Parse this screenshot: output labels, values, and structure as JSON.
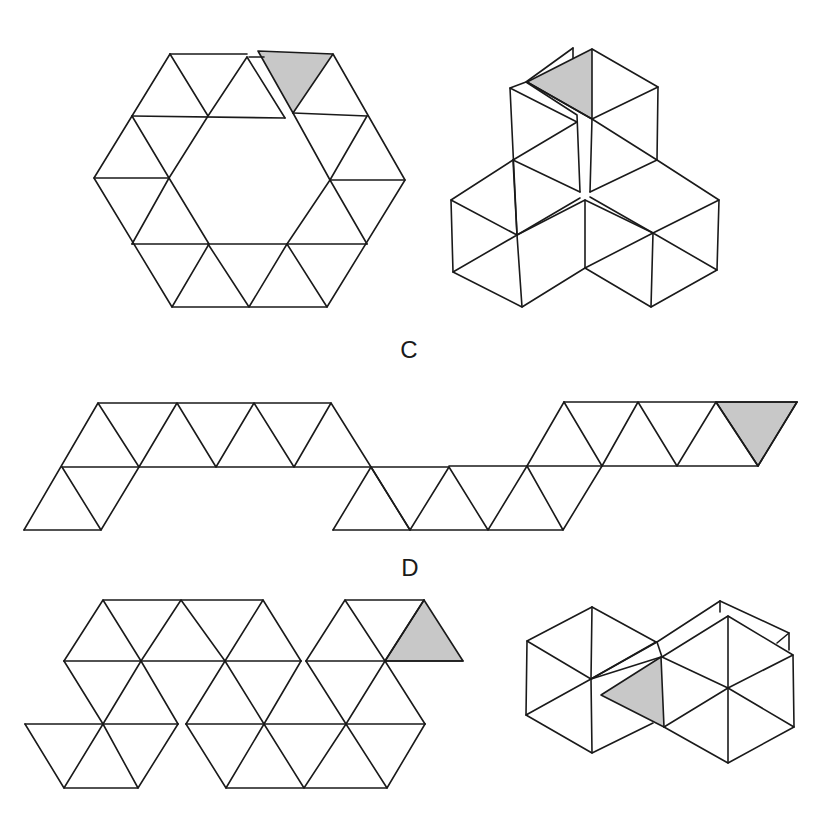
{
  "labels": [
    {
      "id": "C",
      "text": "C",
      "x": 409,
      "y": 350
    },
    {
      "id": "D",
      "text": "D",
      "x": 410,
      "y": 568
    }
  ],
  "colors": {
    "line": "#1a1a1a",
    "shade": "#c8c8c8",
    "background": "#ffffff"
  },
  "figures": [
    {
      "name": "hexagon-ring-net",
      "description": "Flat net: ring of 18 triangles around hexagonal hole, one shaded triangle slit at top",
      "lines": [
        [
          [
            170,
            54
          ],
          [
            247,
            54
          ]
        ],
        [
          [
            170,
            54
          ],
          [
            94,
            178
          ],
          [
            172,
            307
          ],
          [
            327,
            307
          ],
          [
            405,
            180
          ],
          [
            333,
            54
          ]
        ],
        [
          [
            132,
            116
          ],
          [
            285,
            118
          ]
        ],
        [
          [
            293,
            113
          ],
          [
            367,
            116
          ]
        ],
        [
          [
            94,
            178
          ],
          [
            169,
            178
          ]
        ],
        [
          [
            330,
            180
          ],
          [
            405,
            180
          ]
        ],
        [
          [
            132,
            244
          ],
          [
            367,
            244
          ]
        ],
        [
          [
            170,
            54
          ],
          [
            208,
            116
          ],
          [
            169,
            178
          ],
          [
            209,
            244
          ],
          [
            172,
            307
          ]
        ],
        [
          [
            247,
            57
          ],
          [
            208,
            116
          ]
        ],
        [
          [
            132,
            116
          ],
          [
            169,
            178
          ]
        ],
        [
          [
            132,
            244
          ],
          [
            169,
            178
          ]
        ],
        [
          [
            208,
            244
          ],
          [
            249,
            307
          ],
          [
            287,
            244
          ],
          [
            327,
            307
          ]
        ],
        [
          [
            330,
            180
          ],
          [
            367,
            116
          ]
        ],
        [
          [
            330,
            180
          ],
          [
            367,
            244
          ]
        ],
        [
          [
            330,
            180
          ],
          [
            287,
            244
          ]
        ],
        [
          [
            293,
            113
          ],
          [
            330,
            180
          ]
        ],
        [
          [
            247,
            57
          ],
          [
            285,
            118
          ]
        ],
        [
          [
            249,
            57
          ],
          [
            264,
            57
          ]
        ]
      ],
      "shaded": [
        [
          [
            258,
            51
          ],
          [
            333,
            54
          ],
          [
            293,
            113
          ]
        ]
      ]
    },
    {
      "name": "folded-3d-model-top",
      "lines": [
        [
          [
            592,
            49
          ],
          [
            658,
            87
          ],
          [
            592,
            119
          ],
          [
            527,
            82
          ]
        ],
        [
          [
            658,
            87
          ],
          [
            657,
            160
          ]
        ],
        [
          [
            592,
            119
          ],
          [
            590,
            192
          ]
        ],
        [
          [
            573,
            48
          ],
          [
            526,
            82
          ],
          [
            510,
            88
          ],
          [
            517,
            235
          ]
        ],
        [
          [
            573,
            48
          ],
          [
            573,
            58
          ]
        ],
        [
          [
            526,
            82
          ],
          [
            577,
            115
          ],
          [
            580,
            192
          ]
        ],
        [
          [
            510,
            88
          ],
          [
            577,
            122
          ]
        ],
        [
          [
            513,
            160
          ],
          [
            577,
            122
          ]
        ],
        [
          [
            513,
            160
          ],
          [
            580,
            192
          ]
        ],
        [
          [
            592,
            119
          ],
          [
            657,
            160
          ]
        ],
        [
          [
            590,
            192
          ],
          [
            657,
            160
          ]
        ],
        [
          [
            657,
            160
          ],
          [
            719,
            200
          ],
          [
            717,
            270
          ],
          [
            651,
            307
          ],
          [
            585,
            268
          ]
        ],
        [
          [
            719,
            200
          ],
          [
            653,
            233
          ],
          [
            717,
            270
          ]
        ],
        [
          [
            653,
            233
          ],
          [
            651,
            307
          ]
        ],
        [
          [
            653,
            233
          ],
          [
            585,
            268
          ]
        ],
        [
          [
            653,
            233
          ],
          [
            590,
            197
          ]
        ],
        [
          [
            585,
            200
          ],
          [
            653,
            233
          ]
        ],
        [
          [
            513,
            160
          ],
          [
            451,
            200
          ],
          [
            453,
            272
          ],
          [
            522,
            307
          ],
          [
            585,
            268
          ],
          [
            585,
            200
          ],
          [
            517,
            235
          ]
        ],
        [
          [
            451,
            200
          ],
          [
            517,
            235
          ],
          [
            453,
            272
          ]
        ],
        [
          [
            517,
            235
          ],
          [
            522,
            307
          ]
        ],
        [
          [
            513,
            160
          ],
          [
            517,
            235
          ]
        ],
        [
          [
            517,
            235
          ],
          [
            580,
            198
          ]
        ]
      ],
      "shaded": [
        [
          [
            527,
            82
          ],
          [
            592,
            49
          ],
          [
            592,
            119
          ]
        ]
      ]
    },
    {
      "name": "strip-net-C",
      "lines": [
        [
          [
            98,
            403
          ],
          [
            331,
            403
          ]
        ],
        [
          [
            62,
            467
          ],
          [
            449,
            467
          ]
        ],
        [
          [
            24,
            530
          ],
          [
            101,
            530
          ]
        ],
        [
          [
            333,
            530
          ],
          [
            563,
            530
          ]
        ],
        [
          [
            564,
            402
          ],
          [
            797,
            402
          ]
        ],
        [
          [
            449,
            466
          ],
          [
            758,
            466
          ]
        ],
        [
          [
            24,
            530
          ],
          [
            98,
            403
          ],
          [
            139,
            467
          ],
          [
            177,
            403
          ],
          [
            216,
            467
          ],
          [
            254,
            403
          ],
          [
            294,
            467
          ],
          [
            331,
            403
          ],
          [
            371,
            467
          ],
          [
            333,
            530
          ]
        ],
        [
          [
            62,
            467
          ],
          [
            101,
            530
          ],
          [
            139,
            467
          ]
        ],
        [
          [
            371,
            467
          ],
          [
            410,
            530
          ],
          [
            449,
            467
          ],
          [
            488,
            530
          ],
          [
            527,
            466
          ],
          [
            563,
            530
          ],
          [
            602,
            466
          ],
          [
            564,
            402
          ]
        ],
        [
          [
            527,
            466
          ],
          [
            564,
            402
          ]
        ],
        [
          [
            602,
            466
          ],
          [
            638,
            402
          ],
          [
            677,
            466
          ],
          [
            716,
            402
          ],
          [
            758,
            466
          ],
          [
            797,
            402
          ]
        ],
        [
          [
            410,
            530
          ],
          [
            371,
            467
          ]
        ]
      ],
      "shaded": [
        [
          [
            716,
            402
          ],
          [
            797,
            402
          ],
          [
            758,
            466
          ]
        ]
      ]
    },
    {
      "name": "bumpy-net-D",
      "lines": [
        [
          [
            103,
            600
          ],
          [
            263,
            600
          ]
        ],
        [
          [
            345,
            600
          ],
          [
            424,
            600
          ]
        ],
        [
          [
            64,
            661
          ],
          [
            301,
            661
          ]
        ],
        [
          [
            306,
            661
          ],
          [
            463,
            661
          ]
        ],
        [
          [
            25,
            724
          ],
          [
            178,
            724
          ]
        ],
        [
          [
            186,
            724
          ],
          [
            425,
            724
          ]
        ],
        [
          [
            64,
            788
          ],
          [
            138,
            788
          ]
        ],
        [
          [
            226,
            788
          ],
          [
            387,
            788
          ]
        ],
        [
          [
            64,
            661
          ],
          [
            103,
            600
          ],
          [
            141,
            661
          ],
          [
            181,
            600
          ],
          [
            225,
            661
          ],
          [
            263,
            600
          ],
          [
            301,
            661
          ]
        ],
        [
          [
            306,
            661
          ],
          [
            345,
            600
          ],
          [
            385,
            661
          ],
          [
            424,
            600
          ]
        ],
        [
          [
            64,
            661
          ],
          [
            103,
            724
          ],
          [
            141,
            661
          ],
          [
            178,
            724
          ]
        ],
        [
          [
            25,
            724
          ],
          [
            64,
            788
          ],
          [
            103,
            724
          ],
          [
            138,
            788
          ],
          [
            178,
            724
          ]
        ],
        [
          [
            186,
            724
          ],
          [
            226,
            788
          ],
          [
            264,
            724
          ],
          [
            304,
            788
          ],
          [
            346,
            724
          ],
          [
            387,
            788
          ],
          [
            425,
            724
          ]
        ],
        [
          [
            225,
            661
          ],
          [
            264,
            724
          ],
          [
            301,
            661
          ]
        ],
        [
          [
            225,
            661
          ],
          [
            186,
            724
          ]
        ],
        [
          [
            306,
            661
          ],
          [
            346,
            724
          ],
          [
            385,
            661
          ],
          [
            425,
            724
          ]
        ]
      ],
      "shaded": [
        [
          [
            424,
            600
          ],
          [
            463,
            661
          ],
          [
            385,
            661
          ]
        ]
      ]
    },
    {
      "name": "folded-3d-model-bottom",
      "lines": [
        [
          [
            592,
            607
          ],
          [
            527,
            641
          ],
          [
            526,
            715
          ],
          [
            592,
            753
          ],
          [
            653,
            723
          ]
        ],
        [
          [
            592,
            607
          ],
          [
            656,
            642
          ]
        ],
        [
          [
            592,
            607
          ],
          [
            591,
            679
          ],
          [
            592,
            753
          ]
        ],
        [
          [
            527,
            641
          ],
          [
            591,
            679
          ],
          [
            526,
            715
          ]
        ],
        [
          [
            591,
            679
          ],
          [
            656,
            642
          ]
        ],
        [
          [
            591,
            679
          ],
          [
            661,
            657
          ]
        ],
        [
          [
            720,
            601
          ],
          [
            789,
            633
          ],
          [
            789,
            650
          ]
        ],
        [
          [
            720,
            601
          ],
          [
            657,
            642
          ]
        ],
        [
          [
            720,
            601
          ],
          [
            720,
            612
          ]
        ],
        [
          [
            777,
            643
          ],
          [
            789,
            633
          ]
        ],
        [
          [
            662,
            657
          ],
          [
            728,
            616
          ],
          [
            793,
            655
          ],
          [
            794,
            727
          ],
          [
            728,
            763
          ],
          [
            664,
            727
          ]
        ],
        [
          [
            728,
            616
          ],
          [
            728,
            763
          ]
        ],
        [
          [
            662,
            657
          ],
          [
            728,
            688
          ],
          [
            793,
            655
          ]
        ],
        [
          [
            664,
            727
          ],
          [
            728,
            688
          ],
          [
            794,
            727
          ]
        ],
        [
          [
            657,
            642
          ],
          [
            662,
            657
          ]
        ],
        [
          [
            591,
            679
          ],
          [
            657,
            642
          ]
        ]
      ],
      "shaded": [
        [
          [
            601,
            695
          ],
          [
            661,
            657
          ],
          [
            664,
            727
          ]
        ]
      ]
    }
  ]
}
